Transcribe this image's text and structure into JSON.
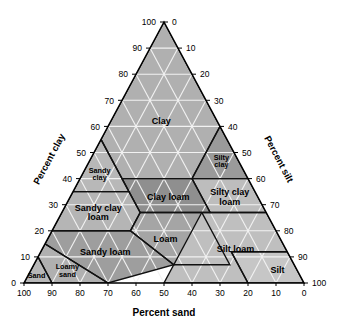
{
  "figure": {
    "type": "ternary-diagram",
    "title_bottom": "Percent sand",
    "axis_left_title": "Percent clay",
    "axis_right_title": "Percent silt",
    "background": "#ffffff",
    "outline_color": "#000000"
  },
  "axes": {
    "bottom": {
      "name": "Percent sand",
      "ticks": [
        "100",
        "90",
        "80",
        "70",
        "60",
        "50",
        "40",
        "30",
        "20",
        "10",
        "0"
      ],
      "direction": "right-to-left-decreasing"
    },
    "left": {
      "name": "Percent clay",
      "ticks": [
        "0",
        "10",
        "20",
        "30",
        "40",
        "50",
        "60",
        "70",
        "80",
        "90",
        "100"
      ],
      "direction": "bottom-to-top-increasing"
    },
    "right": {
      "name": "Percent silt",
      "ticks": [
        "0",
        "10",
        "20",
        "30",
        "40",
        "50",
        "60",
        "70",
        "80",
        "90",
        "100"
      ],
      "direction": "top-to-bottom-increasing"
    }
  },
  "chart_data": {
    "type": "ternary",
    "title": "Percent sand",
    "xlabel": "Percent sand",
    "ylabel": "Percent clay",
    "zlabel": "Percent silt",
    "axis_ranges": [
      0,
      100
    ],
    "grid": true,
    "grid_interval": 10,
    "regions": [
      {
        "label": "Clay",
        "fill": "#b0b0b0",
        "label_pos": {
          "sand": 20,
          "clay": 62,
          "silt": 18
        },
        "vertices": [
          {
            "sand": 0,
            "clay": 100,
            "silt": 0
          },
          {
            "sand": 0,
            "clay": 60,
            "silt": 40
          },
          {
            "sand": 20,
            "clay": 40,
            "silt": 40
          },
          {
            "sand": 45,
            "clay": 40,
            "silt": 15
          },
          {
            "sand": 45,
            "clay": 55,
            "silt": 0
          }
        ]
      },
      {
        "label": "Silty clay",
        "fill": "#9a9a9a",
        "label_pos": {
          "sand": 6,
          "clay": 47,
          "silt": 47
        },
        "vertices": [
          {
            "sand": 0,
            "clay": 60,
            "silt": 40
          },
          {
            "sand": 0,
            "clay": 40,
            "silt": 60
          },
          {
            "sand": 20,
            "clay": 40,
            "silt": 40
          }
        ]
      },
      {
        "label": "Silty clay loam",
        "fill": "#bdbdbd",
        "label_pos": {
          "sand": 10,
          "clay": 33,
          "silt": 57
        },
        "vertices": [
          {
            "sand": 0,
            "clay": 40,
            "silt": 60
          },
          {
            "sand": 0,
            "clay": 27,
            "silt": 73
          },
          {
            "sand": 20,
            "clay": 27,
            "silt": 53
          },
          {
            "sand": 20,
            "clay": 40,
            "silt": 40
          }
        ]
      },
      {
        "label": "Clay loam",
        "fill": "#8f8f8f",
        "label_pos": {
          "sand": 32,
          "clay": 33,
          "silt": 35
        },
        "vertices": [
          {
            "sand": 20,
            "clay": 40,
            "silt": 40
          },
          {
            "sand": 20,
            "clay": 27,
            "silt": 53
          },
          {
            "sand": 45,
            "clay": 27,
            "silt": 28
          },
          {
            "sand": 45,
            "clay": 40,
            "silt": 15
          }
        ]
      },
      {
        "label": "Sandy clay",
        "fill": "#b8b8b8",
        "label_pos": {
          "sand": 52,
          "clay": 42,
          "silt": 6
        },
        "vertices": [
          {
            "sand": 45,
            "clay": 55,
            "silt": 0
          },
          {
            "sand": 45,
            "clay": 35,
            "silt": 20
          },
          {
            "sand": 65,
            "clay": 35,
            "silt": 0
          }
        ]
      },
      {
        "label": "Sandy clay loam",
        "fill": "#b5b5b5",
        "label_pos": {
          "sand": 60,
          "clay": 27,
          "silt": 13
        },
        "vertices": [
          {
            "sand": 45,
            "clay": 35,
            "silt": 20
          },
          {
            "sand": 45,
            "clay": 27,
            "silt": 28
          },
          {
            "sand": 52,
            "clay": 20,
            "silt": 28
          },
          {
            "sand": 80,
            "clay": 20,
            "silt": 0
          },
          {
            "sand": 65,
            "clay": 35,
            "silt": 0
          }
        ]
      },
      {
        "label": "Loam",
        "fill": "#a5a5a5",
        "label_pos": {
          "sand": 41,
          "clay": 17,
          "silt": 42
        },
        "vertices": [
          {
            "sand": 45,
            "clay": 27,
            "silt": 28
          },
          {
            "sand": 23,
            "clay": 27,
            "silt": 50
          },
          {
            "sand": 23,
            "clay": 7,
            "silt": 70
          },
          {
            "sand": 43,
            "clay": 7,
            "silt": 50
          },
          {
            "sand": 52,
            "clay": 20,
            "silt": 28
          }
        ]
      },
      {
        "label": "Sandy loam",
        "fill": "#9e9e9e",
        "label_pos": {
          "sand": 65,
          "clay": 12,
          "silt": 23
        },
        "vertices": [
          {
            "sand": 52,
            "clay": 20,
            "silt": 28
          },
          {
            "sand": 43,
            "clay": 7,
            "silt": 50
          },
          {
            "sand": 70,
            "clay": 0,
            "silt": 30
          },
          {
            "sand": 85,
            "clay": 15,
            "silt": 0
          },
          {
            "sand": 80,
            "clay": 20,
            "silt": 0
          }
        ]
      },
      {
        "label": "Silt loam",
        "fill": "#bfbfbf",
        "label_pos": {
          "sand": 18,
          "clay": 13,
          "silt": 69
        },
        "vertices": [
          {
            "sand": 20,
            "clay": 27,
            "silt": 53
          },
          {
            "sand": 0,
            "clay": 27,
            "silt": 73
          },
          {
            "sand": 0,
            "clay": 12,
            "silt": 88
          },
          {
            "sand": 20,
            "clay": 12,
            "silt": 68
          },
          {
            "sand": 20,
            "clay": 0,
            "silt": 80
          },
          {
            "sand": 50,
            "clay": 0,
            "silt": 50
          },
          {
            "sand": 23,
            "clay": 27,
            "silt": 50
          }
        ]
      },
      {
        "label": "Silt",
        "fill": "#c6c6c6",
        "label_pos": {
          "sand": 7,
          "clay": 5,
          "silt": 88
        },
        "vertices": [
          {
            "sand": 0,
            "clay": 12,
            "silt": 88
          },
          {
            "sand": 20,
            "clay": 12,
            "silt": 68
          },
          {
            "sand": 20,
            "clay": 0,
            "silt": 80
          },
          {
            "sand": 0,
            "clay": 0,
            "silt": 100
          }
        ]
      },
      {
        "label": "Loamy sand",
        "fill": "#b0b0b0",
        "label_pos": {
          "sand": 82,
          "clay": 5,
          "silt": 13
        },
        "vertices": [
          {
            "sand": 85,
            "clay": 15,
            "silt": 0
          },
          {
            "sand": 70,
            "clay": 0,
            "silt": 30
          },
          {
            "sand": 90,
            "clay": 0,
            "silt": 10
          },
          {
            "sand": 90,
            "clay": 10,
            "silt": 0
          }
        ]
      },
      {
        "label": "Sand",
        "fill": "#b8b8b8",
        "label_pos": {
          "sand": 94,
          "clay": 3,
          "silt": 3
        },
        "vertices": [
          {
            "sand": 90,
            "clay": 10,
            "silt": 0
          },
          {
            "sand": 90,
            "clay": 0,
            "silt": 10
          },
          {
            "sand": 100,
            "clay": 0,
            "silt": 0
          }
        ]
      }
    ]
  }
}
